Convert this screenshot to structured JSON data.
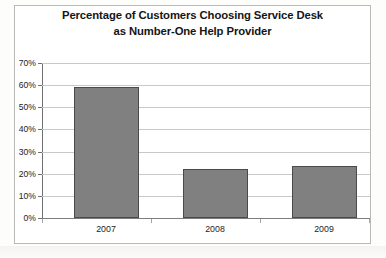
{
  "chart_data": {
    "type": "bar",
    "title": "Percentage of Customers Choosing Service Desk as Number-One Help Provider",
    "title_lines": [
      "Percentage of Customers Choosing Service Desk",
      "as Number-One Help Provider"
    ],
    "categories": [
      "2007",
      "2008",
      "2009"
    ],
    "values": [
      59,
      22,
      23.5
    ],
    "value_labels": [
      "59%",
      "22%",
      "23.5%"
    ],
    "xlabel": "",
    "ylabel": "",
    "ylim": [
      0,
      70
    ],
    "ytick_step": 10,
    "ytick_labels": [
      "70%",
      "60%",
      "50%",
      "40%",
      "30%",
      "20%",
      "10%",
      "0%"
    ],
    "ytick_values": [
      70,
      60,
      50,
      40,
      30,
      20,
      10,
      0
    ],
    "grid": true,
    "legend": false,
    "legend_position": "none",
    "series": [
      {
        "name": "Percentage of Customers",
        "values": [
          59,
          22,
          23.5
        ]
      }
    ],
    "colors": {
      "bar_fill": "#808080",
      "bar_border": "#4a4a4a",
      "gridline": "#c8c8c8",
      "axis": "#6f6f6f",
      "text": "#1c1c1c",
      "title_text": "#151515",
      "frame": "#b9b9b9",
      "background": "#ffffff"
    }
  }
}
